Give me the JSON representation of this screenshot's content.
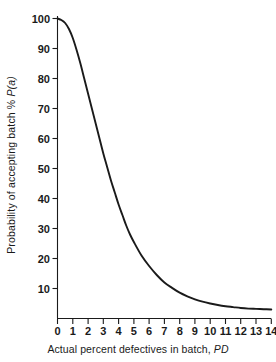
{
  "chart_data": {
    "type": "line",
    "title": "",
    "xlabel": "Actual percent defectives in batch, PD",
    "xlabel_plain": "Actual percent defectives in batch, ",
    "xlabel_italic": "PD",
    "ylabel": "Probability of accepting batch % P(a)",
    "ylabel_plain": "Probability of accepting batch % ",
    "ylabel_italic": "P(a)",
    "xlim": [
      0,
      14
    ],
    "ylim": [
      0,
      100
    ],
    "xticks": [
      0,
      1,
      2,
      3,
      4,
      5,
      6,
      7,
      8,
      9,
      10,
      11,
      12,
      13,
      14
    ],
    "yticks": [
      0,
      10,
      20,
      30,
      40,
      50,
      60,
      70,
      80,
      90,
      100
    ],
    "xtick_labels": [
      "0",
      "1",
      "2",
      "3",
      "4",
      "5",
      "6",
      "7",
      "8",
      "9",
      "10",
      "11",
      "12",
      "13",
      "14"
    ],
    "ytick_labels": [
      "",
      "10",
      "20",
      "30",
      "40",
      "50",
      "60",
      "70",
      "80",
      "90",
      "100"
    ],
    "grid": false,
    "legend": "none",
    "series": [
      {
        "name": "Operating characteristic curve",
        "color": "#1a1a1a",
        "x": [
          0,
          0.25,
          0.5,
          0.75,
          1,
          1.25,
          1.5,
          1.75,
          2,
          2.25,
          2.5,
          2.75,
          3,
          3.25,
          3.5,
          3.75,
          4,
          4.25,
          4.5,
          4.75,
          5,
          5.5,
          6,
          6.5,
          7,
          7.5,
          8,
          8.5,
          9,
          9.5,
          10,
          10.5,
          11,
          11.5,
          12,
          12.5,
          13,
          13.5,
          14
        ],
        "y": [
          100,
          99.5,
          98.5,
          96.5,
          93.5,
          89.5,
          85,
          80,
          75,
          70,
          65,
          60,
          55,
          50.5,
          46,
          42,
          38,
          34.5,
          31,
          28,
          25.5,
          21,
          17.5,
          14.5,
          12,
          10.2,
          8.6,
          7.4,
          6.4,
          5.6,
          5,
          4.5,
          4.1,
          3.8,
          3.5,
          3.3,
          3.2,
          3.1,
          3.0
        ]
      }
    ]
  },
  "axes": {
    "y_axis_name": "probability-of-accepting-batch",
    "x_axis_name": "actual-percent-defectives"
  }
}
